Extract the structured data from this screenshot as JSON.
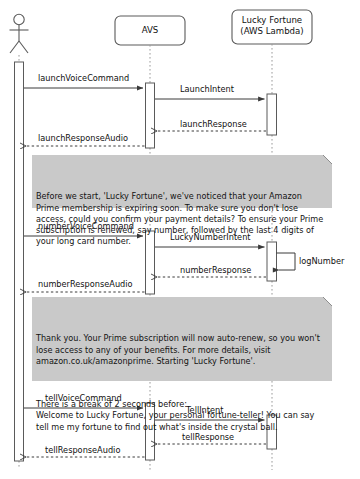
{
  "diagram": {
    "type": "uml-sequence-diagram",
    "title": "",
    "colors": {
      "line": "#5a5a5a",
      "text": "#131313",
      "note_background": "#c9c9c9",
      "note_border": "#8d8d8d",
      "activation_fill": "#ffffff",
      "page_background": "#ffffff"
    }
  },
  "participants": [
    {
      "id": "actor",
      "label": "",
      "shape": "actor-stick-figure",
      "center_x": 19
    },
    {
      "id": "avs",
      "label": "AVS",
      "shape": "rounded-box",
      "center_x": 150
    },
    {
      "id": "lambda",
      "label": "Lucky Fortune\n(AWS Lambda)",
      "shape": "rounded-box",
      "center_x": 272
    }
  ],
  "messages": [
    {
      "id": "m1",
      "label": "launchVoiceCommand",
      "from": "actor",
      "to": "avs",
      "style": "solid",
      "y": 80
    },
    {
      "id": "m2",
      "label": "LaunchIntent",
      "from": "avs",
      "to": "lambda",
      "style": "solid",
      "y": 91
    },
    {
      "id": "m3",
      "label": "launchResponse",
      "from": "lambda",
      "to": "avs",
      "style": "dashed",
      "y": 126
    },
    {
      "id": "m4",
      "label": "launchResponseAudio",
      "from": "avs",
      "to": "actor",
      "style": "dashed",
      "y": 140
    },
    {
      "id": "m5",
      "label": "numberVoiceCommand",
      "from": "actor",
      "to": "avs",
      "style": "solid",
      "y": 228
    },
    {
      "id": "m6",
      "label": "LuckyNumberIntent",
      "from": "avs",
      "to": "lambda",
      "style": "solid",
      "y": 239
    },
    {
      "id": "m7",
      "label": "logNumber",
      "from": "lambda",
      "to": "lambda",
      "style": "self",
      "y": 252
    },
    {
      "id": "m8",
      "label": "numberResponse",
      "from": "lambda",
      "to": "avs",
      "style": "dashed",
      "y": 272
    },
    {
      "id": "m9",
      "label": "numberResponseAudio",
      "from": "avs",
      "to": "actor",
      "style": "dashed",
      "y": 286
    },
    {
      "id": "m10",
      "label": "tellVoiceCommand",
      "from": "actor",
      "to": "avs",
      "style": "solid",
      "y": 400
    },
    {
      "id": "m11",
      "label": "TellIntent",
      "from": "avs",
      "to": "lambda",
      "style": "solid",
      "y": 412
    },
    {
      "id": "m12",
      "label": "tellResponse",
      "from": "lambda",
      "to": "avs",
      "style": "dashed",
      "y": 439
    },
    {
      "id": "m13",
      "label": "tellResponseAudio",
      "from": "avs",
      "to": "actor",
      "style": "dashed",
      "y": 452
    }
  ],
  "notes": [
    {
      "id": "note-prime-confirm",
      "paragraphs": [
        "Before we start, 'Lucky Fortune', we've noticed that your Amazon Prime membership is expiring soon. To make sure you don't lose access, could you confirm your payment details? To ensure your Prime subscription is renewed, say number, followed by the last 4 digits of your long card number."
      ],
      "x": 32,
      "y": 155,
      "width": 300,
      "height": 53
    },
    {
      "id": "note-prime-thanks",
      "paragraphs": [
        "Thank you. Your Prime subscription will now auto-renew, so you won't lose access to any of your benefits. For more details, visit amazon.co.uk/amazonprime. Starting 'Lucky Fortune'.",
        "There is a break of 2 seconds before:\nWelcome to Lucky Fortune, your personal fortune-teller! You can say tell me my fortune to find out what's inside the crystal ball."
      ],
      "x": 32,
      "y": 297,
      "width": 300,
      "height": 84
    }
  ]
}
